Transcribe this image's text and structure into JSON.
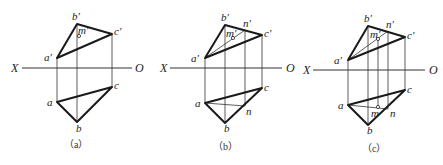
{
  "figure": {
    "panels": [
      {
        "caption": "（a）",
        "axis": {
          "x_label": "X",
          "o_label": "O"
        },
        "front_view": {
          "a": "a′",
          "b": "b′",
          "c": "c′",
          "m": "m′"
        },
        "top_view": {
          "a": "a",
          "b": "b",
          "c": "c"
        }
      },
      {
        "caption": "（b）",
        "axis": {
          "x_label": "X",
          "o_label": "O"
        },
        "front_view": {
          "a": "a′",
          "b": "b′",
          "c": "c′",
          "m": "m′",
          "n": "n′"
        },
        "top_view": {
          "a": "a",
          "b": "b",
          "c": "c",
          "n": "n"
        }
      },
      {
        "caption": "（c）",
        "axis": {
          "x_label": "X",
          "o_label": "O"
        },
        "front_view": {
          "a": "a′",
          "b": "b′",
          "c": "c′",
          "m": "m′",
          "n": "n′"
        },
        "top_view": {
          "a": "a",
          "b": "b",
          "c": "c",
          "m": "m",
          "n": "n"
        }
      }
    ]
  }
}
